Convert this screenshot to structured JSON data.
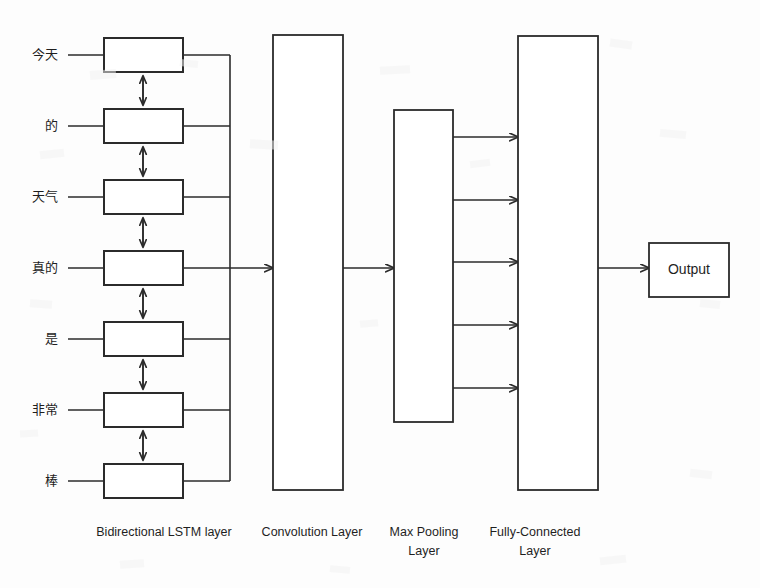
{
  "diagram": {
    "background_color": "#fdfdfd",
    "line_color": "#2b2b2b",
    "input_tokens": [
      {
        "text": "今天"
      },
      {
        "text": "的"
      },
      {
        "text": "天气"
      },
      {
        "text": "真的"
      },
      {
        "text": "是"
      },
      {
        "text": "非常"
      },
      {
        "text": "棒"
      }
    ],
    "layers": [
      {
        "id": "lstm",
        "label": "Bidirectional LSTM layer"
      },
      {
        "id": "conv",
        "label": "Convolution Layer"
      },
      {
        "id": "pool",
        "label": "Max Pooling\nLayer",
        "label_line1": "Max Pooling",
        "label_line2": "Layer"
      },
      {
        "id": "fc",
        "label": "Fully-Connected\nLayer",
        "label_line1": "Fully-Connected",
        "label_line2": "Layer"
      }
    ],
    "output": {
      "label": "Output"
    },
    "connections": {
      "pool_to_fc_arrow_count": 5,
      "lstm_cell_count": 7,
      "bidirectional_arrow_count": 6
    }
  }
}
